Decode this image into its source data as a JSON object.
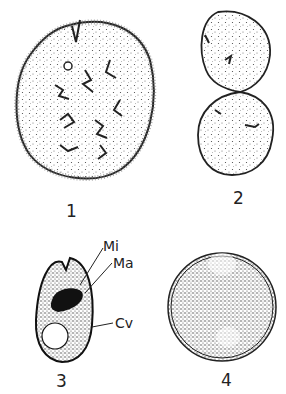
{
  "figure": {
    "panels": [
      {
        "id": "1",
        "label": "1",
        "description": "Large ovoid ciliated cell with cytostome notch at top, small vacuole and branched macronucleus"
      },
      {
        "id": "2",
        "label": "2",
        "description": "Dividing cell, two constricted halves"
      },
      {
        "id": "3",
        "label": "3",
        "description": "Small ovoid cell with notch, stained nuclei and contractile vacuole",
        "annotations": [
          {
            "abbr": "Mi"
          },
          {
            "abbr": "Ma"
          },
          {
            "abbr": "Cv"
          }
        ]
      },
      {
        "id": "4",
        "label": "4",
        "description": "Spherical cyst with double wall"
      }
    ]
  },
  "colors": {
    "ink": "#222222",
    "background": "#ffffff",
    "stipple": "#555555"
  }
}
